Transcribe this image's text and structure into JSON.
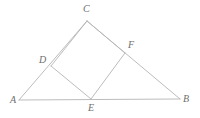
{
  "figure": {
    "canvas": {
      "width": 200,
      "height": 118,
      "background": "#ffffff"
    },
    "style": {
      "stroke_color": "#b4b4b4",
      "stroke_width": 0.9,
      "label_color": "#6e6e6e",
      "label_font_size": 10,
      "label_style": "italic-serif"
    },
    "points": {
      "A": {
        "label": "A",
        "x": 19,
        "y": 100,
        "label_x": 10,
        "label_y": 95,
        "on": "triangle-vertex"
      },
      "B": {
        "label": "B",
        "x": 180,
        "y": 99,
        "label_x": 183,
        "label_y": 94,
        "on": "triangle-vertex"
      },
      "C": {
        "label": "C",
        "x": 87,
        "y": 21,
        "label_x": 83,
        "label_y": 4,
        "on": "triangle-vertex"
      },
      "D": {
        "label": "D",
        "x": 51,
        "y": 66,
        "label_x": 39,
        "label_y": 55,
        "on": "segment-AC"
      },
      "E": {
        "label": "E",
        "x": 91,
        "y": 99,
        "label_x": 88,
        "label_y": 103,
        "on": "segment-AB"
      },
      "F": {
        "label": "F",
        "x": 125,
        "y": 53,
        "label_x": 128,
        "label_y": 40,
        "on": "segment-CB"
      }
    },
    "segments": [
      {
        "name": "side-AB",
        "from": "A",
        "to": "B",
        "d": "M 19 100 L 180 99"
      },
      {
        "name": "side-AC",
        "from": "A",
        "to": "C",
        "d": "M 19 100 L 87 21"
      },
      {
        "name": "side-CB",
        "from": "C",
        "to": "B",
        "d": "M 87 21 L 180 99"
      },
      {
        "name": "square-side-DE",
        "from": "D",
        "to": "E",
        "d": "M 51 66 L 91 99"
      },
      {
        "name": "square-side-EF",
        "from": "E",
        "to": "F",
        "d": "M 91 99 L 125 53"
      },
      {
        "name": "square-side-DC",
        "from": "D",
        "to": "C",
        "d": "M 51 66 L 87 21"
      },
      {
        "name": "square-side-CF",
        "from": "C",
        "to": "F",
        "d": "M 87 21 L 125 53"
      }
    ]
  }
}
